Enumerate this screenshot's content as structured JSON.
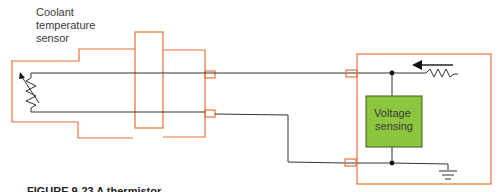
{
  "sensor_label": {
    "line1": "Coolant",
    "line2": "temperature",
    "line3": "sensor"
  },
  "module": {
    "block_label_line1": "Voltage",
    "block_label_line2": "sensing"
  },
  "caption": "FIGURE 9-23 A thermistor",
  "colors": {
    "outline": "#e8713a",
    "wire": "#333333",
    "block_fill": "#8cc63f",
    "block_border": "#3d5a1a"
  },
  "icons": [
    "variable-resistor-icon",
    "resistor-icon",
    "current-arrow-icon",
    "ground-icon",
    "junction-dot-icon"
  ]
}
